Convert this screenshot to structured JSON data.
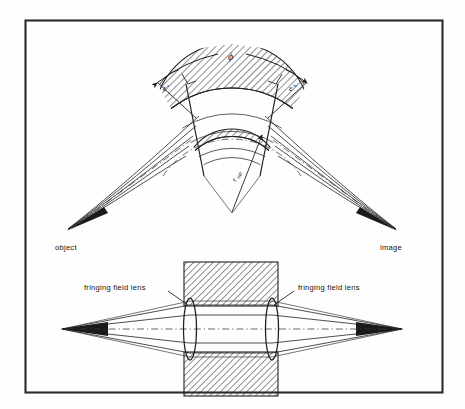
{
  "figure": {
    "kind": "optics-diagram",
    "border_color": "#2b2b2b",
    "background_color": "#fefefe",
    "ink_color": "#1f1f1f"
  },
  "upper_diagram": {
    "name": "sector-field-optics",
    "labels": {
      "sector_angle": "ϕ",
      "entrance_angle": "ε'",
      "exit_angle": "ε\"",
      "mean_radius": "r",
      "mean_radius_subscript": "mo",
      "object_point": "object",
      "image_point": "image"
    },
    "ray_count": 5,
    "pole_band_count": 2,
    "hatch_angle_deg": 45
  },
  "lower_diagram": {
    "name": "equivalent-lens-optics",
    "labels": {
      "left_lens": "fringing field lens",
      "right_lens": "fringing field lens"
    },
    "lens_count": 2,
    "pole_block_count": 2,
    "ray_count": 5,
    "hatch_angle_deg": 45
  }
}
